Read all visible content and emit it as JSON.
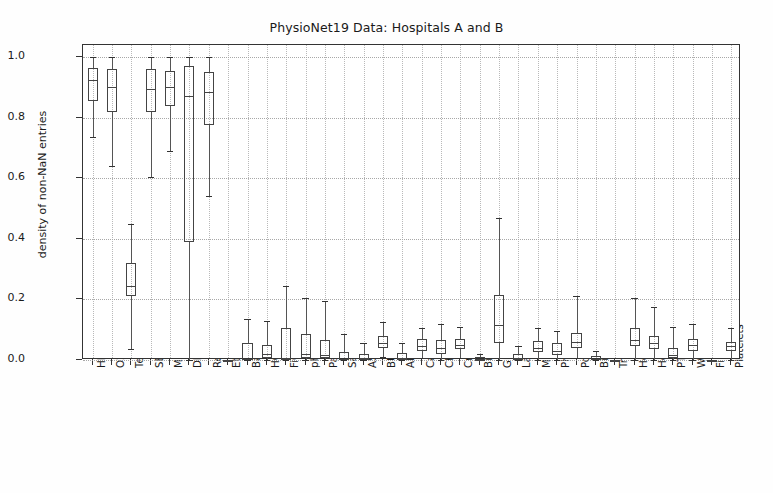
{
  "chart_data": {
    "type": "box",
    "title": "PhysioNet19 Data: Hospitals A and B",
    "xlabel": "",
    "ylabel": "density of non-NaN entries",
    "ylim": [
      0.0,
      1.04
    ],
    "yticks": [
      "0.0",
      "0.2",
      "0.4",
      "0.6",
      "0.8",
      "1.0"
    ],
    "ytick_values": [
      0.0,
      0.2,
      0.4,
      0.6,
      0.8,
      1.0
    ],
    "grid": true,
    "legend": "none",
    "categories": [
      "HR",
      "O2Sat",
      "Temp",
      "SBP",
      "MAP",
      "DBP",
      "Resp",
      "EtCO2",
      "BaseExcess",
      "HCO3",
      "FiO2",
      "pH",
      "PaCO2",
      "SaO2",
      "AST",
      "BUN",
      "Alkalinephos",
      "Calcium",
      "Chloride",
      "Creatinine",
      "Bilirubin_direct",
      "Glucose",
      "Lactate",
      "Magnesium",
      "Phosphate",
      "Potassium",
      "Bilirubin_total",
      "TroponinI",
      "Hct",
      "Hgb",
      "PTT",
      "WBC",
      "Fibrinogen",
      "Platelets"
    ],
    "boxes": [
      {
        "name": "HR",
        "whisker_low": 0.735,
        "q1": 0.855,
        "median": 0.925,
        "q3": 0.965,
        "whisker_high": 1.0
      },
      {
        "name": "O2Sat",
        "whisker_low": 0.64,
        "q1": 0.82,
        "median": 0.9,
        "q3": 0.96,
        "whisker_high": 1.0
      },
      {
        "name": "Temp",
        "whisker_low": 0.035,
        "q1": 0.21,
        "median": 0.245,
        "q3": 0.32,
        "whisker_high": 0.45
      },
      {
        "name": "SBP",
        "whisker_low": 0.605,
        "q1": 0.82,
        "median": 0.895,
        "q3": 0.96,
        "whisker_high": 1.0
      },
      {
        "name": "MAP",
        "whisker_low": 0.69,
        "q1": 0.84,
        "median": 0.9,
        "q3": 0.955,
        "whisker_high": 1.0
      },
      {
        "name": "DBP",
        "whisker_low": 0.0,
        "q1": 0.39,
        "median": 0.87,
        "q3": 0.97,
        "whisker_high": 1.0
      },
      {
        "name": "Resp",
        "whisker_low": 0.54,
        "q1": 0.775,
        "median": 0.885,
        "q3": 0.95,
        "whisker_high": 1.0
      },
      {
        "name": "EtCO2",
        "whisker_low": 0.0,
        "q1": 0.0,
        "median": 0.0,
        "q3": 0.0,
        "whisker_high": 0.0
      },
      {
        "name": "BaseExcess",
        "whisker_low": 0.0,
        "q1": 0.0,
        "median": 0.003,
        "q3": 0.055,
        "whisker_high": 0.135
      },
      {
        "name": "HCO3",
        "whisker_low": 0.0,
        "q1": 0.005,
        "median": 0.02,
        "q3": 0.05,
        "whisker_high": 0.13
      },
      {
        "name": "FiO2",
        "whisker_low": 0.0,
        "q1": 0.0,
        "median": 0.005,
        "q3": 0.105,
        "whisker_high": 0.245
      },
      {
        "name": "pH",
        "whisker_low": 0.0,
        "q1": 0.005,
        "median": 0.02,
        "q3": 0.085,
        "whisker_high": 0.205
      },
      {
        "name": "PaCO2",
        "whisker_low": 0.0,
        "q1": 0.005,
        "median": 0.015,
        "q3": 0.065,
        "whisker_high": 0.195
      },
      {
        "name": "SaO2",
        "whisker_low": 0.0,
        "q1": 0.0,
        "median": 0.003,
        "q3": 0.025,
        "whisker_high": 0.085
      },
      {
        "name": "AST",
        "whisker_low": 0.0,
        "q1": 0.0,
        "median": 0.005,
        "q3": 0.02,
        "whisker_high": 0.055
      },
      {
        "name": "BUN",
        "whisker_low": 0.01,
        "q1": 0.04,
        "median": 0.055,
        "q3": 0.08,
        "whisker_high": 0.125
      },
      {
        "name": "Alkalinephos",
        "whisker_low": 0.0,
        "q1": 0.0,
        "median": 0.005,
        "q3": 0.022,
        "whisker_high": 0.055
      },
      {
        "name": "Calcium",
        "whisker_low": 0.005,
        "q1": 0.03,
        "median": 0.045,
        "q3": 0.068,
        "whisker_high": 0.105
      },
      {
        "name": "Chloride",
        "whisker_low": 0.0,
        "q1": 0.02,
        "median": 0.04,
        "q3": 0.065,
        "whisker_high": 0.12
      },
      {
        "name": "Creatinine",
        "whisker_low": 0.005,
        "q1": 0.035,
        "median": 0.05,
        "q3": 0.07,
        "whisker_high": 0.11
      },
      {
        "name": "Bilirubin_direct",
        "whisker_low": 0.0,
        "q1": 0.0,
        "median": 0.0,
        "q3": 0.01,
        "whisker_high": 0.02
      },
      {
        "name": "Glucose",
        "whisker_low": 0.0,
        "q1": 0.055,
        "median": 0.115,
        "q3": 0.215,
        "whisker_high": 0.47
      },
      {
        "name": "Lactate",
        "whisker_low": 0.0,
        "q1": 0.0,
        "median": 0.005,
        "q3": 0.02,
        "whisker_high": 0.045
      },
      {
        "name": "Magnesium",
        "whisker_low": 0.0,
        "q1": 0.025,
        "median": 0.04,
        "q3": 0.062,
        "whisker_high": 0.105
      },
      {
        "name": "Phosphate",
        "whisker_low": 0.0,
        "q1": 0.015,
        "median": 0.03,
        "q3": 0.055,
        "whisker_high": 0.095
      },
      {
        "name": "Potassium",
        "whisker_low": 0.005,
        "q1": 0.04,
        "median": 0.06,
        "q3": 0.09,
        "whisker_high": 0.21
      },
      {
        "name": "Bilirubin_total",
        "whisker_low": 0.0,
        "q1": 0.0,
        "median": 0.003,
        "q3": 0.012,
        "whisker_high": 0.03
      },
      {
        "name": "TroponinI",
        "whisker_low": 0.0,
        "q1": 0.0,
        "median": 0.0,
        "q3": 0.0,
        "whisker_high": 0.0
      },
      {
        "name": "Hct",
        "whisker_low": 0.0,
        "q1": 0.045,
        "median": 0.065,
        "q3": 0.105,
        "whisker_high": 0.205
      },
      {
        "name": "Hgb",
        "whisker_low": 0.0,
        "q1": 0.035,
        "median": 0.055,
        "q3": 0.08,
        "whisker_high": 0.175
      },
      {
        "name": "PTT",
        "whisker_low": 0.0,
        "q1": 0.005,
        "median": 0.015,
        "q3": 0.04,
        "whisker_high": 0.11
      },
      {
        "name": "WBC",
        "whisker_low": 0.0,
        "q1": 0.03,
        "median": 0.048,
        "q3": 0.068,
        "whisker_high": 0.12
      },
      {
        "name": "Fibrinogen",
        "whisker_low": 0.0,
        "q1": 0.0,
        "median": 0.0,
        "q3": 0.0,
        "whisker_high": 0.0
      },
      {
        "name": "Platelets",
        "whisker_low": 0.0,
        "q1": 0.03,
        "median": 0.045,
        "q3": 0.06,
        "whisker_high": 0.105
      }
    ]
  },
  "colors": {
    "box_edge": "#444444",
    "whisker": "#555555",
    "cap": "#333333",
    "grid": "#9a9a9a",
    "axis": "#333333",
    "text": "#1a1a1a",
    "background": "#ffffff"
  }
}
